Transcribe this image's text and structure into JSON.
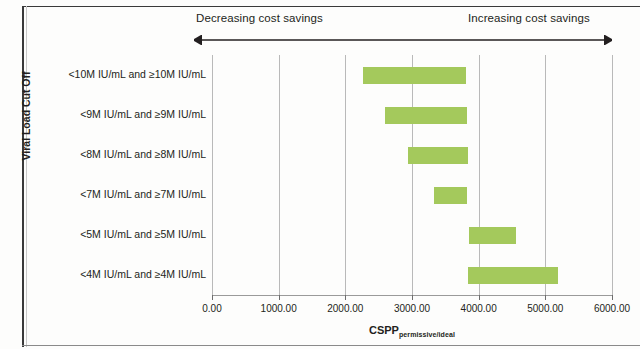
{
  "annotations": {
    "decreasing_label": "Decreasing  cost savings",
    "increasing_label": "Increasing cost savings",
    "arrow_name": "double-headed-arrow"
  },
  "axes": {
    "y_title": "Viral Load Cut Off",
    "x_title_main": "CSPP",
    "x_title_sub": "permissive/ideal"
  },
  "colors": {
    "bar": "#a4c95c",
    "gridline": "#b9b9b9",
    "text": "#231f20"
  },
  "chart_data": {
    "type": "bar",
    "orientation": "horizontal",
    "title": "",
    "xlabel": "CSPP permissive/ideal",
    "ylabel": "Viral Load Cut Off",
    "xlim": [
      0,
      6000
    ],
    "ylim": null,
    "grid": true,
    "legend": null,
    "xticks": [
      0,
      1000,
      2000,
      3000,
      4000,
      5000,
      6000
    ],
    "xtick_labels": [
      "0.00",
      "1000.00",
      "2000.00",
      "3000.00",
      "4000.00",
      "5000.00",
      "6000.00"
    ],
    "categories": [
      "<10M IU/mL and ≥10M IU/mL",
      "<9M IU/mL and ≥9M IU/mL",
      "<8M IU/mL and ≥8M IU/mL",
      "<7M IU/mL and ≥7M IU/mL",
      "<5M IU/mL and ≥5M IU/mL",
      "<4M IU/mL and ≥4M IU/mL"
    ],
    "bars": [
      {
        "category": "<10M IU/mL and ≥10M IU/mL",
        "start": 2270,
        "end": 3815
      },
      {
        "category": "<9M IU/mL and ≥9M IU/mL",
        "start": 2590,
        "end": 3830
      },
      {
        "category": "<8M IU/mL and ≥8M IU/mL",
        "start": 2935,
        "end": 3845
      },
      {
        "category": "<7M IU/mL and ≥7M IU/mL",
        "start": 3330,
        "end": 3830
      },
      {
        "category": "<5M IU/mL and ≥5M IU/mL",
        "start": 3860,
        "end": 4555
      },
      {
        "category": "<4M IU/mL and ≥4M IU/mL",
        "start": 3845,
        "end": 5190
      }
    ],
    "annotations": [
      {
        "text": "Decreasing  cost savings",
        "position": "top-left"
      },
      {
        "text": "Increasing cost savings",
        "position": "top-right"
      }
    ]
  }
}
